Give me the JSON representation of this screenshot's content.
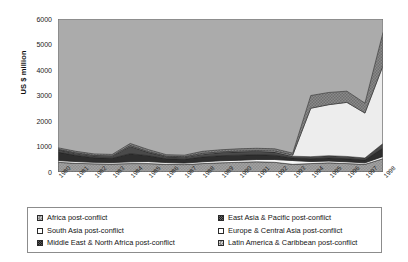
{
  "axes": {
    "ylabel": "US $ million",
    "yticks": [
      "6000",
      "5000",
      "4000",
      "3000",
      "2000",
      "1000",
      "0"
    ],
    "xticks": [
      "1980",
      "1981",
      "1982",
      "1983",
      "1984",
      "1985",
      "1986",
      "1987",
      "1988",
      "1989",
      "1990",
      "1991",
      "1992",
      "1993",
      "1994",
      "1995",
      "1996",
      "1997",
      "1998"
    ]
  },
  "legend": {
    "left": [
      {
        "label": "Africa post-conflict",
        "swatch": "swatch-africa"
      },
      {
        "label": "South Asia post-conflict",
        "swatch": "swatch-south-asia"
      },
      {
        "label": "Middle East & North Africa post-conflict",
        "swatch": "swatch-mena"
      }
    ],
    "right": [
      {
        "label": "East Asia & Pacific post-conflict",
        "swatch": "swatch-east-asia"
      },
      {
        "label": "Europe & Central Asia post-conflict",
        "swatch": "swatch-europe"
      },
      {
        "label": "Latin America & Caribbean post-conflict",
        "swatch": "swatch-latin-america"
      }
    ]
  },
  "chart_data": {
    "type": "area",
    "stacked": true,
    "title": "",
    "xlabel": "",
    "ylabel": "US $ million",
    "ylim": [
      0,
      6000
    ],
    "ytick_step": 1000,
    "grid": false,
    "legend_position": "bottom",
    "plot_background": "#ababab",
    "x": [
      "1980",
      "1981",
      "1982",
      "1983",
      "1984",
      "1985",
      "1986",
      "1987",
      "1988",
      "1989",
      "1990",
      "1991",
      "1992",
      "1993",
      "1994",
      "1995",
      "1996",
      "1997",
      "1998"
    ],
    "series": [
      {
        "name": "Africa post-conflict",
        "color": "#a0a0a0",
        "values": [
          380,
          340,
          320,
          310,
          330,
          330,
          300,
          290,
          330,
          360,
          380,
          400,
          380,
          300,
          330,
          360,
          330,
          300,
          520
        ]
      },
      {
        "name": "South Asia post-conflict",
        "color": "#f7f7f7",
        "values": [
          70,
          70,
          60,
          60,
          70,
          80,
          70,
          60,
          70,
          80,
          80,
          90,
          110,
          150,
          80,
          70,
          70,
          60,
          90
        ]
      },
      {
        "name": "Middle East & North Africa post-conflict",
        "color": "#2e2e2e",
        "values": [
          330,
          240,
          180,
          170,
          320,
          230,
          150,
          150,
          190,
          200,
          200,
          190,
          170,
          100,
          110,
          120,
          120,
          110,
          330
        ]
      },
      {
        "name": "East Asia & Pacific post-conflict",
        "color": "#4a4a4a",
        "values": [
          90,
          80,
          70,
          70,
          290,
          130,
          80,
          80,
          110,
          120,
          130,
          130,
          120,
          70,
          80,
          90,
          90,
          80,
          180
        ]
      },
      {
        "name": "Europe & Central Asia post-conflict",
        "color": "#ededed",
        "values": [
          20,
          20,
          20,
          20,
          30,
          30,
          20,
          20,
          30,
          30,
          30,
          30,
          40,
          40,
          1900,
          2000,
          2120,
          1760,
          3050
        ]
      },
      {
        "name": "Latin America & Caribbean post-conflict",
        "color": "#7a7a7a",
        "values": [
          60,
          60,
          60,
          60,
          80,
          80,
          60,
          60,
          80,
          80,
          90,
          90,
          90,
          80,
          500,
          480,
          440,
          390,
          1300
        ]
      }
    ],
    "totals": [
      950,
      810,
      710,
      690,
      1120,
      880,
      680,
      660,
      810,
      870,
      910,
      930,
      910,
      740,
      3000,
      3120,
      3170,
      2700,
      5470
    ]
  }
}
